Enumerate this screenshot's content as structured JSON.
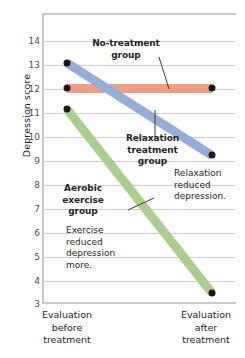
{
  "chart_data": {
    "type": "line",
    "title": "",
    "xlabel": "",
    "ylabel": "Depression score",
    "x": [
      "Evaluation before treatment",
      "Evaluation after treatment"
    ],
    "ylim": [
      3,
      14.95
    ],
    "yticks": [
      14,
      13,
      12,
      11,
      10,
      9,
      8,
      7,
      6,
      5,
      4,
      3
    ],
    "ytick_labels": [
      "14",
      "13",
      "12",
      "11",
      "10",
      "9",
      "8",
      "7",
      "6",
      "5",
      "4",
      "3"
    ],
    "grid": true,
    "legend": "inline-annotations",
    "series": [
      {
        "name": "No-treatment group",
        "values": [
          11.85,
          11.85
        ],
        "color": "#ef9d84"
      },
      {
        "name": "Relaxation treatment group",
        "values": [
          12.9,
          9.1
        ],
        "color": "#93aed8"
      },
      {
        "name": "Aerobic exercise group",
        "values": [
          11.0,
          3.45
        ],
        "color": "#a9cf8d"
      }
    ],
    "annotations": [
      {
        "id": "no-treatment-label",
        "text_lines": [
          "No-treatment",
          "group"
        ],
        "bold": true
      },
      {
        "id": "relaxation-label",
        "text_lines": [
          "Relaxation",
          "treatment",
          "group"
        ],
        "bold": true
      },
      {
        "id": "aerobic-label",
        "text_lines": [
          "Aerobic",
          "exercise",
          "group"
        ],
        "bold": true
      },
      {
        "id": "relaxation-note",
        "text_lines": [
          "Relaxation",
          "reduced",
          "depression."
        ],
        "bold": false
      },
      {
        "id": "exercise-note",
        "text_lines": [
          "Exercise",
          "reduced",
          "depression",
          "more."
        ],
        "bold": false
      }
    ]
  },
  "axis": {
    "y_title": "Depression score",
    "ticks": [
      "14",
      "13",
      "12",
      "11",
      "10",
      "9",
      "8",
      "7",
      "6",
      "5",
      "4",
      "3"
    ],
    "x_left_lines": [
      "Evaluation",
      "before",
      "treatment"
    ],
    "x_right_lines": [
      "Evaluation",
      "after",
      "treatment"
    ]
  },
  "labels": {
    "no_treatment_l1": "No-treatment",
    "no_treatment_l2": "group",
    "relaxation_l1": "Relaxation",
    "relaxation_l2": "treatment",
    "relaxation_l3": "group",
    "aerobic_l1": "Aerobic",
    "aerobic_l2": "exercise",
    "aerobic_l3": "group",
    "relax_note_l1": "Relaxation",
    "relax_note_l2": "reduced",
    "relax_note_l3": "depression.",
    "exercise_note_l1": "Exercise",
    "exercise_note_l2": "reduced",
    "exercise_note_l3": "depression",
    "exercise_note_l4": "more."
  },
  "colors": {
    "no_treatment": "#ef9d84",
    "relaxation": "#93aed8",
    "aerobic": "#a9cf8d",
    "grid": "#cfcfcf",
    "axis": "#c9c9c9",
    "marker": "#1a1a1a",
    "text": "#231f20"
  }
}
